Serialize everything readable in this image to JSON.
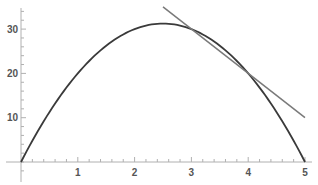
{
  "chart_data": {
    "type": "line",
    "title": "",
    "xlabel": "",
    "ylabel": "",
    "xlim": [
      0,
      5
    ],
    "ylim": [
      -3,
      35
    ],
    "grid": false,
    "legend": null,
    "x_ticks": [
      1,
      2,
      3,
      4,
      5
    ],
    "y_ticks": [
      10,
      20,
      30
    ],
    "series": [
      {
        "name": "curve",
        "expression": "y = 25x - 5x^2",
        "color": "#3a3a3a",
        "x": [
          0,
          0.5,
          1,
          1.5,
          2,
          2.5,
          3,
          3.5,
          4,
          4.5,
          5
        ],
        "y": [
          0,
          11.25,
          20,
          26.25,
          30,
          31.25,
          30,
          26.25,
          20,
          11.25,
          0
        ]
      },
      {
        "name": "secant line",
        "expression": "y = 60 - 10x",
        "color": "#7a7a7a",
        "x": [
          2.5,
          5
        ],
        "y": [
          35,
          10
        ]
      }
    ]
  }
}
